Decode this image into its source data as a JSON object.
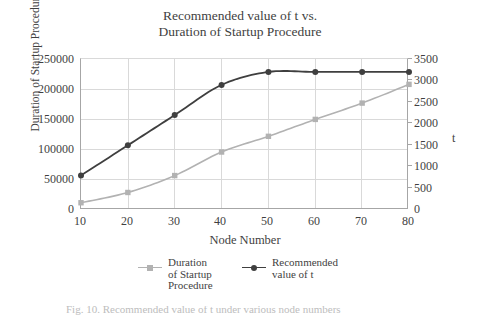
{
  "chart_data": {
    "type": "line",
    "title": "Recommended value of t vs. Duration of Startup Procedure",
    "title_lines": [
      "Recommended value of t vs.",
      "Duration of Startup Procedure"
    ],
    "xlabel": "Node Number",
    "ylabel": "Duration of Startup Procedure(ms)",
    "y2label": "t",
    "x": [
      10,
      20,
      30,
      40,
      50,
      60,
      70,
      80
    ],
    "xtick_labels": [
      "10",
      "20",
      "30",
      "40",
      "50",
      "60",
      "70",
      "80"
    ],
    "xlim": [
      10,
      80
    ],
    "ylim": [
      0,
      250000
    ],
    "ytick_labels": [
      "0",
      "50000",
      "100000",
      "150000",
      "200000",
      "250000"
    ],
    "ytick_values": [
      0,
      50000,
      100000,
      150000,
      200000,
      250000
    ],
    "y2lim": [
      0,
      3500
    ],
    "y2tick_labels": [
      "0",
      "500",
      "1000",
      "1500",
      "2000",
      "2500",
      "3000",
      "3500"
    ],
    "y2tick_values": [
      0,
      500,
      1000,
      1500,
      2000,
      2500,
      3000,
      3500
    ],
    "grid": true,
    "legend_position": "bottom",
    "series": [
      {
        "name": "Duration of Startup Procedure",
        "name_lines": [
          "Duration",
          "of Startup",
          "Procedure"
        ],
        "axis": "left",
        "color": "#b2b2b2",
        "marker": "square",
        "values": [
          12000,
          29000,
          57000,
          96000,
          122000,
          150000,
          177000,
          208000
        ]
      },
      {
        "name": "Recommended value of t",
        "name_lines": [
          "Recommended",
          "value of t"
        ],
        "axis": "right",
        "color": "#3f3f3f",
        "marker": "circle",
        "values": [
          800,
          1500,
          2200,
          2900,
          3200,
          3200,
          3200,
          3200
        ]
      }
    ]
  },
  "colors": {
    "series_gray": "#b2b2b2",
    "series_dark": "#3f3f3f",
    "gridline": "#d9d9d9",
    "axis": "#a6a6a6",
    "text": "#3f3f3f",
    "background": "#ffffff"
  },
  "caption": {
    "partial_text": "Fig. 10.  Recommended value of t under various node numbers"
  }
}
